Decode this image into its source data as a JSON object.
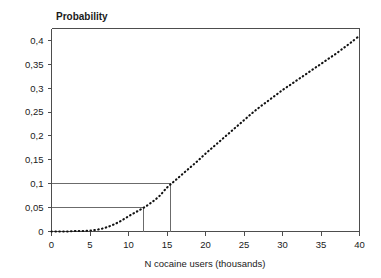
{
  "chart_data": {
    "type": "line",
    "title": "Probability",
    "xlabel": "N cocaine users (thousands)",
    "ylabel": "",
    "xlim": [
      0,
      40
    ],
    "ylim": [
      0,
      0.425
    ],
    "grid": false,
    "legend": null,
    "line_style": "dotted",
    "xticks": [
      0,
      5,
      10,
      15,
      20,
      25,
      30,
      35,
      40
    ],
    "xtick_labels": [
      "0",
      "5",
      "10",
      "15",
      "20",
      "25",
      "30",
      "35",
      "40"
    ],
    "yticks": [
      0,
      0.05,
      0.1,
      0.15,
      0.2,
      0.25,
      0.3,
      0.35,
      0.4
    ],
    "ytick_labels": [
      "0",
      "0,05",
      "0,1",
      "0,15",
      "0,2",
      "0,25",
      "0,3",
      "0,35",
      "0,4"
    ],
    "series": [
      {
        "name": "Probability curve",
        "x": [
          0,
          1,
          2,
          3,
          4,
          5,
          6,
          7,
          8,
          9,
          10,
          11,
          12,
          13,
          14,
          15,
          16,
          17,
          18,
          19,
          20,
          21,
          22,
          23,
          24,
          25,
          26,
          27,
          28,
          29,
          30,
          31,
          32,
          33,
          34,
          35,
          36,
          37,
          38,
          39,
          40
        ],
        "y": [
          0.0,
          0.0,
          0.0,
          0.001,
          0.001,
          0.002,
          0.004,
          0.008,
          0.014,
          0.022,
          0.032,
          0.041,
          0.05,
          0.061,
          0.074,
          0.092,
          0.106,
          0.12,
          0.134,
          0.148,
          0.163,
          0.177,
          0.191,
          0.205,
          0.219,
          0.233,
          0.247,
          0.26,
          0.272,
          0.284,
          0.296,
          0.307,
          0.318,
          0.329,
          0.34,
          0.351,
          0.362,
          0.373,
          0.385,
          0.397,
          0.41
        ]
      }
    ],
    "annotations": [
      {
        "name": "reference-0.05",
        "type": "reference-lines",
        "y": 0.05,
        "x": 12,
        "description": "Horizontal line from y-axis to curve at probability 0,05, dropping to N = 12 thousand"
      },
      {
        "name": "reference-0.10",
        "type": "reference-lines",
        "y": 0.1,
        "x": 15.5,
        "description": "Horizontal line from y-axis to curve at probability 0,1, dropping to N = 15,5 thousand"
      }
    ]
  },
  "colors": {
    "curve": "#111111",
    "axis": "#4d4d4d",
    "reference": "#6b6b6b",
    "background": "#ffffff",
    "text": "#1a1a1a"
  }
}
